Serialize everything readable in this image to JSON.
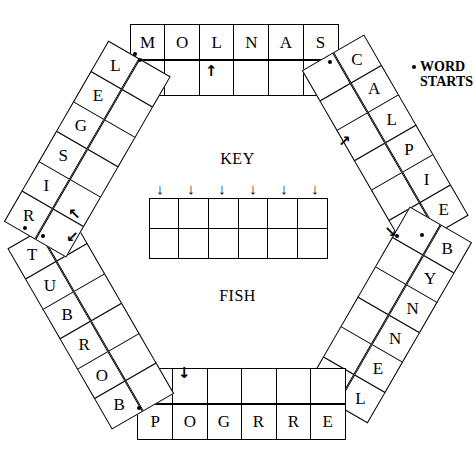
{
  "puzzle": {
    "center": {
      "key_label": "KEY",
      "fish_label": "FISH",
      "key_columns": 6,
      "key_rows": 2,
      "key_cells": [
        [
          "",
          "",
          "",
          "",
          "",
          ""
        ],
        [
          "",
          "",
          "",
          "",
          "",
          ""
        ]
      ],
      "key_arrows": [
        "↓",
        "↓",
        "↓",
        "↓",
        "↓",
        "↓"
      ]
    },
    "legend": {
      "bullet_symbol": "•",
      "line1": "WORD",
      "line2": "STARTS"
    },
    "bands": [
      {
        "id": "top",
        "position": "top",
        "rotation_deg": 0,
        "outer_row": [
          "M",
          "O",
          "L",
          "N",
          "A",
          "S"
        ],
        "inner_row": [
          "",
          "",
          "",
          "",
          "",
          ""
        ],
        "arrow": "↑"
      },
      {
        "id": "upper-right",
        "position": "upper-right",
        "rotation_deg": 60,
        "outer_row": [
          "C",
          "A",
          "L",
          "P",
          "I",
          "E"
        ],
        "inner_row": [
          "",
          "",
          "",
          "",
          "",
          ""
        ],
        "arrow": "↗"
      },
      {
        "id": "lower-right",
        "position": "lower-right",
        "rotation_deg": 120,
        "outer_row": [
          "B",
          "Y",
          "N",
          "N",
          "E",
          "L"
        ],
        "inner_row": [
          "",
          "",
          "",
          "",
          "",
          ""
        ],
        "arrow": "↘"
      },
      {
        "id": "bottom",
        "position": "bottom",
        "rotation_deg": 180,
        "outer_row": [
          "P",
          "O",
          "G",
          "R",
          "R",
          "E"
        ],
        "inner_row": [
          "",
          "",
          "",
          "",
          "",
          ""
        ],
        "arrow": "↓"
      },
      {
        "id": "lower-left",
        "position": "lower-left",
        "rotation_deg": 240,
        "outer_row": [
          "T",
          "U",
          "B",
          "R",
          "O",
          "B"
        ],
        "inner_row": [
          "",
          "",
          "",
          "",
          "",
          ""
        ],
        "arrow": "↙"
      },
      {
        "id": "upper-left",
        "position": "upper-left",
        "rotation_deg": 300,
        "outer_row": [
          "L",
          "E",
          "G",
          "S",
          "I",
          "R"
        ],
        "inner_row": [
          "",
          "",
          "",
          "",
          "",
          ""
        ],
        "arrow": "↖"
      }
    ],
    "word_start_dots": 8
  }
}
